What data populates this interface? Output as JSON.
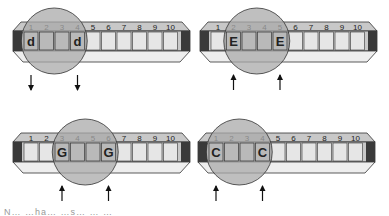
{
  "diagram": {
    "type": "harmonica-octave-tongue-block",
    "hole_numbers": [
      "1",
      "2",
      "3",
      "4",
      "5",
      "6",
      "7",
      "8",
      "9",
      "10"
    ],
    "colors": {
      "body": "#c8c8c8",
      "body_light": "#eeeeee",
      "hole": "#e6e6e6",
      "end_cap": "#3a3a3a",
      "mouth_circle": "#a9a9a9",
      "outline": "#333333"
    },
    "panels": [
      {
        "id": "d-octave",
        "note": "d",
        "holes": [
          1,
          4
        ],
        "covered_holes": [
          1,
          2,
          3,
          4
        ],
        "breath": "draw",
        "arrow_direction": "down"
      },
      {
        "id": "e-octave",
        "note": "E",
        "holes": [
          2,
          5
        ],
        "covered_holes": [
          2,
          3,
          4,
          5
        ],
        "breath": "blow",
        "arrow_direction": "up"
      },
      {
        "id": "g-octave",
        "note": "G",
        "holes": [
          3,
          6
        ],
        "covered_holes": [
          3,
          4,
          5,
          6
        ],
        "breath": "blow",
        "arrow_direction": "up"
      },
      {
        "id": "c-octave",
        "note": "C",
        "holes": [
          1,
          4
        ],
        "covered_holes": [
          1,
          2,
          3,
          4
        ],
        "breath": "blow",
        "arrow_direction": "up"
      }
    ],
    "caption_fragment": "N… …ha… …s… … …"
  }
}
